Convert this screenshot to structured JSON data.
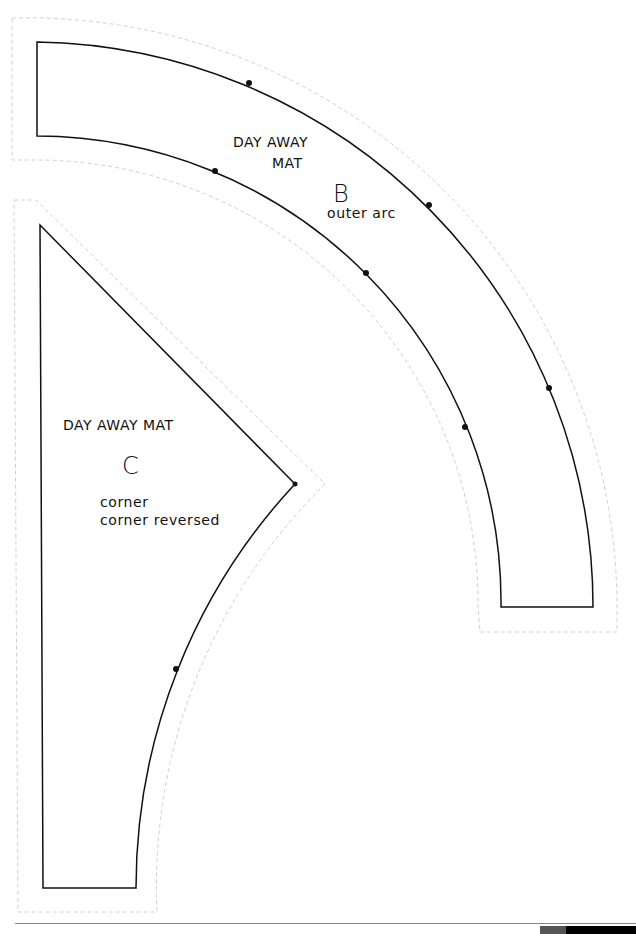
{
  "document": {
    "type": "sewing pattern sheet",
    "pieces": [
      {
        "id": "B",
        "title_line1": "DAY AWAY",
        "title_line2": "MAT",
        "letter": "B",
        "description": "outer arc"
      },
      {
        "id": "C",
        "title": "DAY AWAY MAT",
        "letter": "C",
        "description_line1": "corner",
        "description_line2": "corner reversed"
      }
    ]
  },
  "colors": {
    "cut_line": "#111111",
    "seam_allowance_dashed": "#cccccc",
    "background": "#ffffff"
  }
}
